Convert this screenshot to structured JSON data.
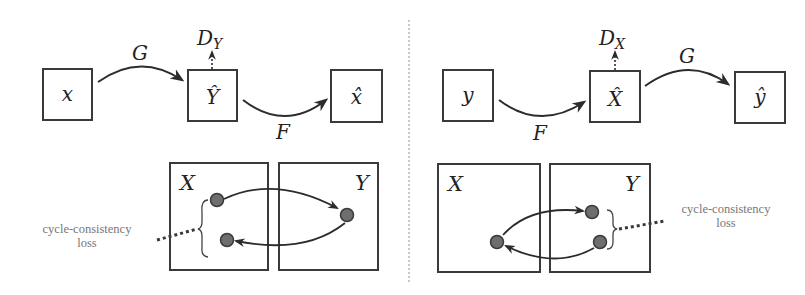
{
  "diagram": {
    "type": "cycle-consistency-illustration",
    "panels": [
      {
        "id": "left",
        "top": {
          "nodes": [
            {
              "id": "x",
              "label": "x"
            },
            {
              "id": "Y_hat",
              "label": "Ŷ"
            },
            {
              "id": "x_hat",
              "label": "x̂"
            }
          ],
          "edges": [
            {
              "from": "x",
              "to": "Y_hat",
              "label": "G"
            },
            {
              "from": "Y_hat",
              "to": "x_hat",
              "label": "F"
            }
          ],
          "discriminator": {
            "main": "D",
            "sub": "Y",
            "attached_to": "Y_hat"
          }
        },
        "bottom": {
          "domains": [
            {
              "id": "X",
              "label": "X"
            },
            {
              "id": "Y",
              "label": "Y"
            }
          ],
          "loss_label_line1": "cycle-consistency",
          "loss_label_line2": "loss",
          "loss_side": "X"
        }
      },
      {
        "id": "right",
        "top": {
          "nodes": [
            {
              "id": "y",
              "label": "y"
            },
            {
              "id": "X_hat",
              "label": "X̂"
            },
            {
              "id": "y_hat",
              "label": "ŷ"
            }
          ],
          "edges": [
            {
              "from": "y",
              "to": "X_hat",
              "label": "F"
            },
            {
              "from": "X_hat",
              "to": "y_hat",
              "label": "G"
            }
          ],
          "discriminator": {
            "main": "D",
            "sub": "X",
            "attached_to": "X_hat"
          }
        },
        "bottom": {
          "domains": [
            {
              "id": "X",
              "label": "X"
            },
            {
              "id": "Y",
              "label": "Y"
            }
          ],
          "loss_label_line1": "cycle-consistency",
          "loss_label_line2": "loss",
          "loss_side": "Y"
        }
      }
    ],
    "colors": {
      "stroke": "#3a3a3a",
      "dot_fill": "#6e6e6e",
      "loss_text": "#777777",
      "divider": "#b8b8b8"
    }
  }
}
